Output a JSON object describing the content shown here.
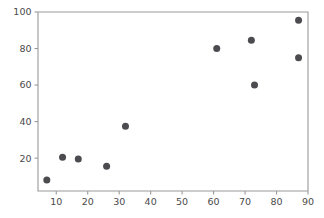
{
  "chart_data": {
    "type": "scatter",
    "title": "",
    "subtitle": "",
    "xlabel": "",
    "ylabel": "",
    "xlim": [
      4.2,
      90.0
    ],
    "ylim": [
      2.0,
      100.0
    ],
    "grid": false,
    "legend": null,
    "marker": {
      "shape": "circle",
      "color": "#4c4c50",
      "size_px": 7
    },
    "xticks": [
      10,
      20,
      30,
      40,
      50,
      60,
      70,
      80,
      90
    ],
    "xtick_labels": [
      "10",
      "20",
      "30",
      "40",
      "50",
      "60",
      "70",
      "80",
      "90"
    ],
    "yticks": [
      20,
      40,
      60,
      80,
      100
    ],
    "ytick_labels": [
      "20",
      "40",
      "60",
      "80",
      "100"
    ],
    "points": [
      {
        "x": 7,
        "y": 8.0
      },
      {
        "x": 12,
        "y": 20.5
      },
      {
        "x": 17,
        "y": 19.5
      },
      {
        "x": 26,
        "y": 15.5
      },
      {
        "x": 32,
        "y": 37.5
      },
      {
        "x": 61,
        "y": 80.0
      },
      {
        "x": 72,
        "y": 84.5
      },
      {
        "x": 73,
        "y": 60.0
      },
      {
        "x": 87,
        "y": 95.5
      },
      {
        "x": 87,
        "y": 75.0
      }
    ],
    "series": [
      {
        "name": "series-1",
        "x": [
          7,
          12,
          17,
          26,
          32,
          61,
          72,
          73,
          87,
          87
        ],
        "y": [
          8.0,
          20.5,
          19.5,
          15.5,
          37.5,
          80.0,
          84.5,
          60.0,
          95.5,
          75.0
        ]
      }
    ],
    "annotations": []
  },
  "figure": {
    "background_color": "#ffffff",
    "axes_color": "#9a9a9a",
    "tick_label_color": "#4a4a4a",
    "plot_box": {
      "left": 38,
      "top": 12,
      "right": 308,
      "bottom": 191
    }
  }
}
